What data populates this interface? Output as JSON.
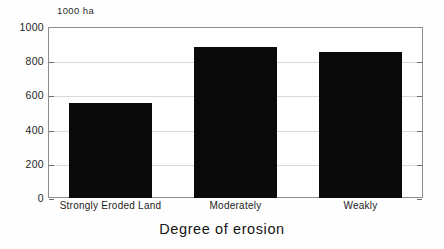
{
  "chart_data": {
    "type": "bar",
    "title": "",
    "subtitle": "",
    "xlabel": "Degree of erosion",
    "ylabel": "",
    "unit_label": "1000 ha",
    "categories": [
      "Strongly Eroded Land",
      "Moderately",
      "Weakly"
    ],
    "values": [
      555,
      883,
      854
    ],
    "series": [
      {
        "name": "Eroded land area",
        "values": [
          555,
          883,
          854
        ]
      }
    ],
    "ylim": [
      0,
      1000
    ],
    "yticks": [
      0,
      200,
      400,
      600,
      800,
      1000
    ],
    "ytick_labels": [
      "0",
      "200",
      "400",
      "600",
      "800",
      "1000"
    ],
    "grid": true,
    "grid_axis": "y",
    "legend": false,
    "legend_position": "none",
    "bar_color": "#0a0a0a",
    "grid_color": "#d9d9d9",
    "frame_color": "#8d8d8d",
    "text_color": "#1c1c1c",
    "background": "#ffffff"
  }
}
